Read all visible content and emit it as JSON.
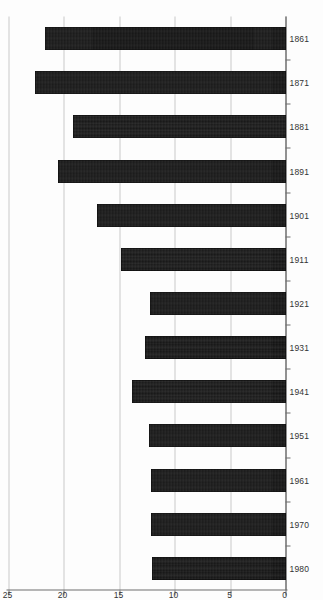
{
  "chart_data": {
    "type": "bar",
    "orientation": "horizontal",
    "title": "",
    "subtitle": "",
    "xlabel": "per 1000 people",
    "ylabel": "",
    "categories": [
      "1980",
      "1970",
      "1961",
      "1951",
      "1941",
      "1931",
      "1921",
      "1911",
      "1901",
      "1891",
      "1881",
      "1871",
      "1861"
    ],
    "values": [
      12.0,
      12.1,
      12.1,
      12.3,
      13.8,
      12.6,
      12.2,
      14.8,
      17.0,
      20.5,
      19.1,
      22.6,
      21.7
    ],
    "value_tick_labels": [
      "0",
      "5",
      "10",
      "15",
      "20",
      "25"
    ],
    "value_ticks": [
      0,
      5,
      10,
      15,
      20,
      25
    ],
    "xlim": [
      0,
      25
    ],
    "grid": true,
    "grid_axis": "value",
    "legend": false,
    "legend_position": "none",
    "bar_color": "#151515",
    "grid_color": "#c9c9c9",
    "axis_color": "#6f6f6f",
    "background_color": "#fdfdfd",
    "rotation_degrees": -90,
    "annotations": []
  },
  "axis": {
    "value_title": "per 1000 people"
  }
}
